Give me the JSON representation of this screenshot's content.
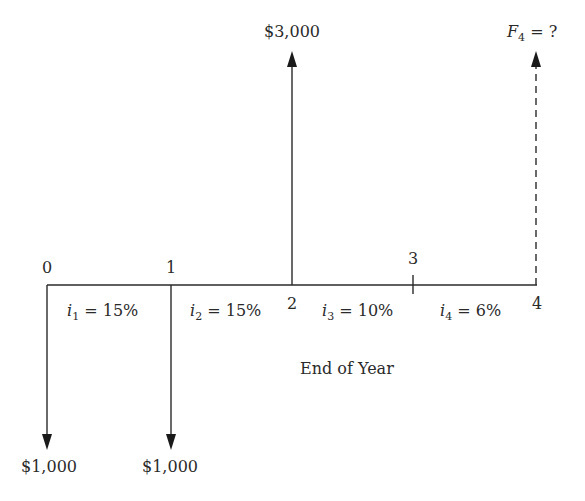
{
  "diagram": {
    "type": "cash-flow-diagram",
    "axis_label": "End of Year",
    "periods": [
      {
        "id": "0",
        "label": "0"
      },
      {
        "id": "1",
        "label": "1"
      },
      {
        "id": "2",
        "label": "2"
      },
      {
        "id": "3",
        "label": "3"
      },
      {
        "id": "4",
        "label": "4"
      }
    ],
    "rates": [
      {
        "var": "i",
        "sub": "1",
        "text": " = 15%"
      },
      {
        "var": "i",
        "sub": "2",
        "text": " = 15%"
      },
      {
        "var": "i",
        "sub": "3",
        "text": " = 10%"
      },
      {
        "var": "i",
        "sub": "4",
        "text": " = 6%"
      }
    ],
    "cash_flows": [
      {
        "period": "0",
        "direction": "down",
        "label": "$1,000"
      },
      {
        "period": "1",
        "direction": "down",
        "label": "$1,000"
      },
      {
        "period": "2",
        "direction": "up",
        "label": "$3,000"
      },
      {
        "period": "4",
        "direction": "up",
        "style": "dashed",
        "var": "F",
        "sub": "4",
        "text": " = ?"
      }
    ],
    "line_color": "#2a2a2a"
  }
}
